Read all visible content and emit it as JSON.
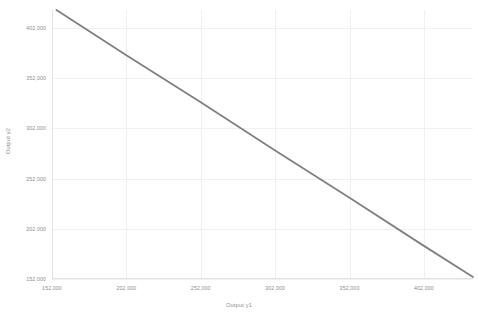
{
  "chart_data": {
    "type": "line",
    "title": "",
    "subtitle": "",
    "xlabel": "Output y1",
    "ylabel": "Output y2",
    "xlim": [
      152000,
      435000
    ],
    "ylim": [
      152000,
      420000
    ],
    "xticks": [
      152000,
      202000,
      252000,
      302000,
      352000,
      402000
    ],
    "xticklabels": [
      "152,000",
      "202,000",
      "252,000",
      "302,000",
      "352,000",
      "402,000"
    ],
    "yticks": [
      152000,
      202000,
      252000,
      302000,
      352000,
      402000
    ],
    "yticklabels": [
      "152,000",
      "202,000",
      "252,000",
      "302,000",
      "352,000",
      "402,000"
    ],
    "grid": true,
    "legend": false,
    "legend_position": "none",
    "series": [
      {
        "name": "frontier",
        "color": "#808080",
        "linewidth": 1.8,
        "x": [
          155000,
          435000
        ],
        "y": [
          420000,
          154000
        ],
        "points": [
          {
            "x": 155000,
            "y": 420000
          },
          {
            "x": 202000,
            "y": 375000
          },
          {
            "x": 252000,
            "y": 328000
          },
          {
            "x": 302000,
            "y": 280000
          },
          {
            "x": 352000,
            "y": 233000
          },
          {
            "x": 402000,
            "y": 185000
          },
          {
            "x": 435000,
            "y": 154000
          }
        ]
      }
    ],
    "colors": {
      "line": "#808080",
      "grid": "#f0f0f0",
      "axis": "#e2e2e2",
      "tick_text": "#8d8d8d",
      "background": "#ffffff"
    }
  }
}
